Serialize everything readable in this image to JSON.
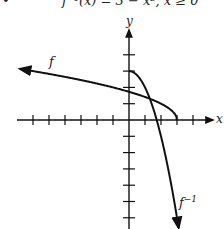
{
  "header": {
    "bullet": "•",
    "equation": "f⁻¹(x) = 3 − x², x ≥ 0"
  },
  "labels": {
    "x_axis": "x",
    "y_axis": "y",
    "f": "f",
    "f_inverse_base": "f",
    "f_inverse_sup": "−1"
  },
  "chart_data": {
    "type": "line",
    "title": "f⁻¹(x) = 3 − x², x ≥ 0",
    "xlabel": "x",
    "ylabel": "y",
    "xlim": [
      -7,
      5.3
    ],
    "ylim": [
      -6.6,
      5.5
    ],
    "grid": false,
    "tick_spacing": 1,
    "x_ticks": [
      -6,
      -5,
      -4,
      -3,
      -2,
      -1,
      1,
      2,
      3,
      4
    ],
    "y_ticks": [
      -6,
      -5,
      -4,
      -3,
      -2,
      -1,
      1,
      2,
      3,
      4
    ],
    "series": [
      {
        "name": "f",
        "formula": "f(x) = sqrt(3 - x), x <= 3",
        "points": [
          [
            -6.8,
            3.13
          ],
          [
            -5,
            2.83
          ],
          [
            -3,
            2.45
          ],
          [
            -1,
            2.0
          ],
          [
            0,
            1.73
          ],
          [
            1,
            1.41
          ],
          [
            2,
            1.0
          ],
          [
            2.5,
            0.71
          ],
          [
            3,
            0
          ]
        ],
        "arrow": "left"
      },
      {
        "name": "f^-1",
        "formula": "f^-1(x) = 3 - x^2, x >= 0",
        "points": [
          [
            0,
            3
          ],
          [
            0.5,
            2.75
          ],
          [
            1,
            2
          ],
          [
            1.5,
            0.75
          ],
          [
            2,
            -1
          ],
          [
            2.5,
            -3.25
          ],
          [
            3,
            -6
          ],
          [
            3.1,
            -6.6
          ]
        ],
        "arrow": "down"
      }
    ],
    "annotations": [
      {
        "text": "f",
        "near": [
          -5,
          3.3
        ]
      },
      {
        "text": "f^-1",
        "near": [
          3.3,
          -5.9
        ]
      }
    ]
  }
}
